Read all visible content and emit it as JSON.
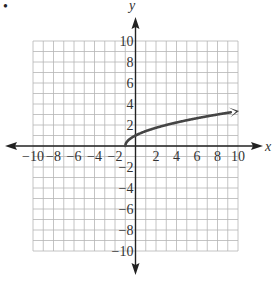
{
  "problem": {
    "bullet": "•"
  },
  "chart_data": {
    "type": "line",
    "title": "",
    "xlabel": "x",
    "ylabel": "y",
    "xlim": [
      -10,
      10
    ],
    "ylim": [
      -10,
      10
    ],
    "grid": true,
    "grid_step": 1,
    "x_ticks": [
      -10,
      -8,
      -6,
      -4,
      -2,
      2,
      4,
      6,
      8,
      10
    ],
    "y_ticks": [
      10,
      8,
      6,
      4,
      2,
      -2,
      -4,
      -6,
      -8,
      -10
    ],
    "x_tick_labels": [
      "−10",
      "−8",
      "−6",
      "−4",
      "−2",
      "2",
      "4",
      "6",
      "8",
      "10"
    ],
    "y_tick_labels": [
      "10",
      "8",
      "6",
      "4",
      "2",
      "−2",
      "−4",
      "−6",
      "−8",
      "−10"
    ],
    "series": [
      {
        "name": "y = √(x + 1)",
        "start_point": [
          -1,
          0
        ],
        "end_arrow": true,
        "x": [
          -1,
          -0.75,
          0,
          1,
          2,
          3,
          4,
          5,
          6,
          7,
          8,
          9,
          10
        ],
        "y": [
          0,
          0.5,
          1,
          1.41,
          1.73,
          2,
          2.24,
          2.45,
          2.65,
          2.83,
          3,
          3.16,
          3.32
        ],
        "color": "#444444"
      }
    ],
    "legend": null,
    "annotations": []
  },
  "colors": {
    "grid": "#b5b5b5",
    "axis": "#222222",
    "curve": "#454545"
  }
}
